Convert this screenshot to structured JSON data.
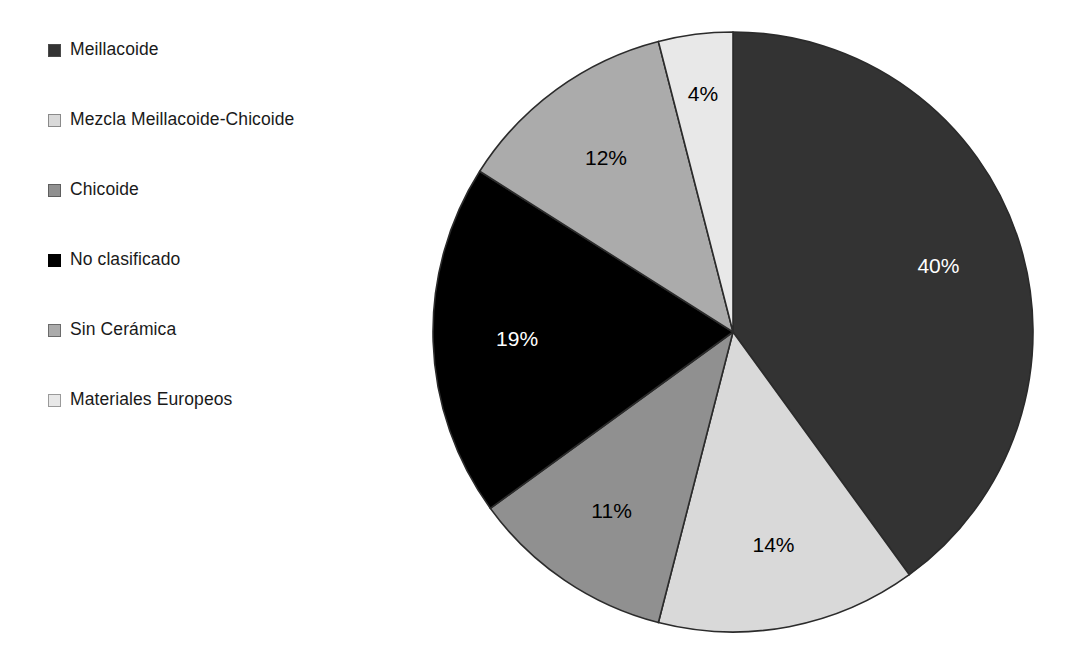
{
  "legend": {
    "items": [
      {
        "label": "Meillacoide",
        "color": "#333333",
        "swatch_border": "#4a4a4a"
      },
      {
        "label": "Mezcla Meillacoide-Chicoide",
        "color": "#d9d9d9",
        "swatch_border": "#8a8a8a"
      },
      {
        "label": "Chicoide",
        "color": "#909090",
        "swatch_border": "#5e5e5e"
      },
      {
        "label": "No clasificado",
        "color": "#000000",
        "swatch_border": "#000000"
      },
      {
        "label": "Sin Cerámica",
        "color": "#ababab",
        "swatch_border": "#6b6b6b"
      },
      {
        "label": "Materiales Europeos",
        "color": "#e8e8e8",
        "swatch_border": "#9a9a9a"
      }
    ]
  },
  "pie": {
    "center_x": 733,
    "center_y": 332,
    "radius": 300,
    "start_angle_deg": -90,
    "direction": "clockwise",
    "outline_color": "#2b2b2b"
  },
  "chart_data": {
    "type": "pie",
    "title": "",
    "categories": [
      "Meillacoide",
      "Mezcla Meillacoide-Chicoide",
      "Chicoide",
      "No clasificado",
      "Sin Cerámica",
      "Materiales Europeos"
    ],
    "values": [
      40,
      14,
      11,
      19,
      12,
      4
    ],
    "value_unit": "%",
    "data_labels": [
      "40%",
      "14%",
      "11%",
      "19%",
      "12%",
      "4%"
    ],
    "slice_colors": [
      "#333333",
      "#d9d9d9",
      "#909090",
      "#000000",
      "#ababab",
      "#e8e8e8"
    ],
    "label_text_colors": [
      "#ffffff",
      "#000000",
      "#000000",
      "#ffffff",
      "#000000",
      "#000000"
    ],
    "legend_position": "left",
    "grid": false,
    "xlabel": "",
    "ylabel": ""
  }
}
